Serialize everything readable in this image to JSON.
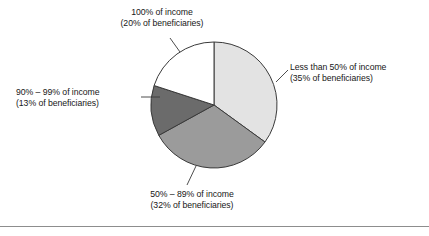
{
  "chart_data": {
    "type": "pie",
    "title": "",
    "xlabel": "",
    "ylabel": "",
    "legend_position": "labels-with-leader-lines",
    "grid": false,
    "categories": [
      "Less than 50% of income",
      "50% – 89% of income",
      "90% – 99% of income",
      "100% of income"
    ],
    "values": [
      35,
      32,
      13,
      20
    ],
    "value_unit": "% of beneficiaries",
    "colors": [
      "#e3e3e3",
      "#9b9b9b",
      "#6b6b6b",
      "#ffffff"
    ],
    "slice_edge_color": "#3a3a3a",
    "start_angle_deg": 0,
    "direction": "clockwise",
    "labels": [
      {
        "name": "less-than-50",
        "line1": "Less than 50% of income",
        "line2": "(35% of beneficiaries)",
        "value": 35,
        "color": "#e3e3e3"
      },
      {
        "name": "50-to-89",
        "line1": "50% – 89% of income",
        "line2": "(32% of beneficiaries)",
        "value": 32,
        "color": "#9b9b9b"
      },
      {
        "name": "90-to-99",
        "line1": "90% – 99% of income",
        "line2": "(13% of beneficiaries)",
        "value": 13,
        "color": "#6b6b6b"
      },
      {
        "name": "100-percent",
        "line1": "100% of income",
        "line2": "(20% of beneficiaries)",
        "value": 20,
        "color": "#ffffff"
      }
    ]
  }
}
